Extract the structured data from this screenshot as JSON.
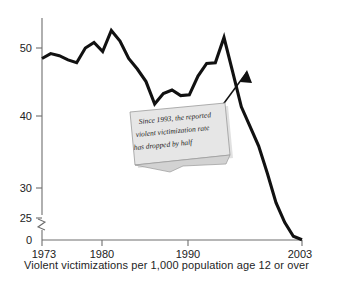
{
  "chart_data": {
    "type": "line",
    "title": "",
    "subtitle": "",
    "xlabel": "",
    "ylabel": "",
    "caption": "Violent victimizations per 1,000 population age 12 or over",
    "x": [
      1973,
      1974,
      1975,
      1976,
      1977,
      1978,
      1979,
      1980,
      1981,
      1982,
      1983,
      1984,
      1985,
      1986,
      1987,
      1988,
      1989,
      1990,
      1991,
      1992,
      1993,
      1994,
      1995,
      1996,
      1997,
      1998,
      1999,
      2000,
      2001,
      2002,
      2003
    ],
    "values": [
      48.5,
      49.2,
      48.9,
      48.3,
      47.9,
      50.0,
      50.8,
      49.5,
      52.5,
      51.0,
      48.5,
      47.0,
      45.2,
      42.0,
      43.5,
      44.0,
      43.2,
      43.3,
      46.0,
      47.8,
      47.9,
      51.5,
      46.6,
      41.6,
      38.8,
      36.0,
      32.1,
      27.9,
      25.1,
      23.1,
      22.6
    ],
    "ylim": [
      25,
      55
    ],
    "xlim": [
      1973,
      2003
    ],
    "yticks": [
      25,
      30,
      40,
      50
    ],
    "ytick_labels": [
      "25",
      "30",
      "40",
      "50"
    ],
    "zero_label": "0",
    "axis_break": true,
    "xticks": [
      1973,
      1980,
      1990,
      2003
    ],
    "xtick_labels": [
      "1973",
      "1980",
      "1990",
      "2003"
    ],
    "grid": false,
    "legend": null,
    "series_color": "#111111",
    "annotation": {
      "lines": [
        "Since 1993, the reported",
        "violent victimization rate",
        "has dropped by half"
      ],
      "points_to_year": 1994,
      "points_to_value": 51.5,
      "box_color": "#e6e6e6"
    }
  }
}
